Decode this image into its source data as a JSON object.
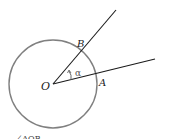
{
  "diagram": {
    "labels": {
      "center": "O",
      "point_a": "A",
      "point_b": "B",
      "angle": "α"
    },
    "caption_partial": "...∠AOB",
    "colors": {
      "circle": "#808080",
      "rays": "#1a1a1a",
      "angle_arrow": "#666666"
    }
  }
}
